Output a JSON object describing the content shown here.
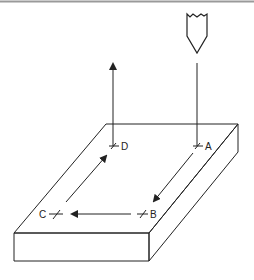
{
  "diagram": {
    "points": [
      {
        "id": "A",
        "label": "A"
      },
      {
        "id": "B",
        "label": "B"
      },
      {
        "id": "C",
        "label": "C"
      },
      {
        "id": "D",
        "label": "D"
      }
    ],
    "path_order": [
      "A",
      "B",
      "C",
      "D"
    ],
    "colors": {
      "line": "#222222",
      "top_rule": "#9a9a9a",
      "background": "#ffffff"
    }
  }
}
